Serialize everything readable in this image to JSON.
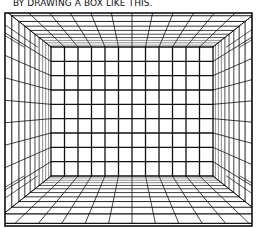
{
  "panel": {
    "caption": "BY DRAWING A BOX LIKE THIS.",
    "frame": {
      "left": 5,
      "top": 13,
      "right": 252,
      "bottom": 226
    },
    "back_wall": {
      "left": 51,
      "top": 47,
      "right": 213,
      "bottom": 176,
      "columns": 12,
      "rows": 9
    },
    "colors": {
      "ink": "#111111",
      "light_ink": "#555555",
      "background": "#ffffff"
    },
    "floor_depth_lines": [
      176,
      178,
      181,
      184,
      187,
      191,
      195,
      199,
      204,
      209,
      215,
      221
    ],
    "ceiling_depth_lines": [
      47,
      45,
      43,
      41,
      39,
      36,
      33,
      30,
      27,
      23,
      19,
      15
    ],
    "side_depth_fractions": [
      0,
      0.04,
      0.09,
      0.14,
      0.2,
      0.27,
      0.35,
      0.44,
      0.54,
      0.66,
      0.8,
      1.0
    ]
  }
}
